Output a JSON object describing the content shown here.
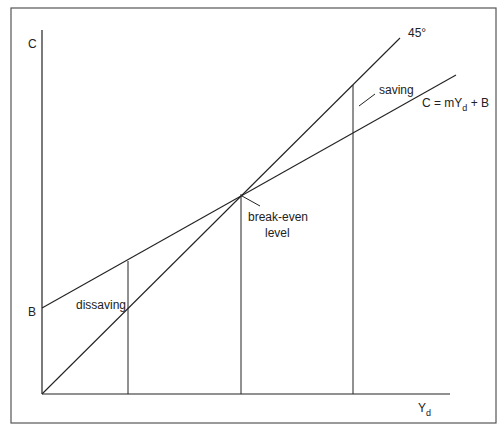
{
  "diagram": {
    "type": "consumption-function",
    "frame": {
      "x": 11,
      "y": 8,
      "width": 485,
      "height": 415,
      "stroke": "#555555"
    },
    "axes": {
      "origin": [
        42,
        394
      ],
      "y_axis_top": [
        42,
        30
      ],
      "x_axis_right": [
        450,
        394
      ],
      "y_label": "C",
      "x_label_main": "Y",
      "x_label_sub": "d"
    },
    "lines": {
      "forty_five": {
        "from": [
          42,
          394
        ],
        "to": [
          400,
          38
        ],
        "label": "45°"
      },
      "consumption": {
        "from": [
          42,
          308
        ],
        "to": [
          456,
          75
        ],
        "label_main": "C = mY",
        "label_sub": "d",
        "label_tail": " + B"
      }
    },
    "intercept_label": "B",
    "verticals": [
      {
        "x": 128,
        "top": 261
      },
      {
        "x": 241,
        "top": 194
      },
      {
        "x": 353,
        "top": 85
      }
    ],
    "annotations": {
      "dissaving": "dissaving",
      "saving": "saving",
      "break_even_line1": "break-even",
      "break_even_line2": "level"
    },
    "colors": {
      "line": "#222222",
      "text": "#222222",
      "frame": "#555555"
    }
  }
}
